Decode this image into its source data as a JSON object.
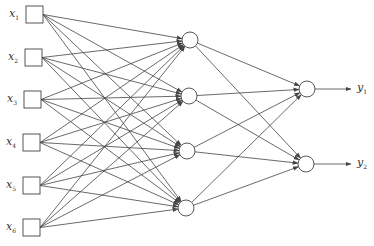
{
  "diagram": {
    "type": "feedforward-neural-network",
    "colors": {
      "stroke": "#444444",
      "background": "#ffffff",
      "text": "#333333"
    },
    "input_layer": {
      "nodes": [
        {
          "id": "x1",
          "label": "x",
          "sub": "1",
          "x": 26,
          "y": 6
        },
        {
          "id": "x2",
          "label": "x",
          "sub": "2",
          "x": 25,
          "y": 49
        },
        {
          "id": "x3",
          "label": "x",
          "sub": "3",
          "x": 24,
          "y": 91
        },
        {
          "id": "x4",
          "label": "x",
          "sub": "4",
          "x": 23,
          "y": 134
        },
        {
          "id": "x5",
          "label": "x",
          "sub": "5",
          "x": 23,
          "y": 177
        },
        {
          "id": "x6",
          "label": "x",
          "sub": "6",
          "x": 23,
          "y": 219
        }
      ],
      "box_size": 17
    },
    "hidden_layer": {
      "nodes": [
        {
          "id": "h1",
          "cx": 190,
          "cy": 40
        },
        {
          "id": "h2",
          "cx": 189,
          "cy": 96
        },
        {
          "id": "h3",
          "cx": 187,
          "cy": 151
        },
        {
          "id": "h4",
          "cx": 186,
          "cy": 208
        }
      ],
      "radius": 8
    },
    "output_layer": {
      "nodes": [
        {
          "id": "o1",
          "cx": 307,
          "cy": 89,
          "label": "y",
          "sub": "1"
        },
        {
          "id": "o2",
          "cx": 306,
          "cy": 164,
          "label": "y",
          "sub": "2"
        }
      ],
      "radius": 8,
      "arrow_end_x": 351
    }
  }
}
